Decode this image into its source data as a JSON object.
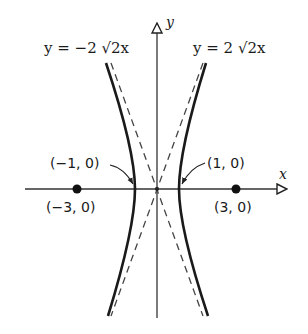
{
  "diagram": {
    "type": "hyperbola",
    "axes": {
      "x_label": "x",
      "y_label": "y"
    },
    "asymptotes": [
      {
        "label": "y = −2 √2x",
        "slope_text": "-2√2"
      },
      {
        "label": "y = 2 √2x",
        "slope_text": "2√2"
      }
    ],
    "vertices": [
      {
        "label": "(−1, 0)"
      },
      {
        "label": "(1, 0)"
      }
    ],
    "foci": [
      {
        "label": "(−3, 0)"
      },
      {
        "label": "(3, 0)"
      }
    ],
    "colors": {
      "curve": "#1a1a1a",
      "axis": "#333333",
      "asymptote": "#444444"
    }
  }
}
